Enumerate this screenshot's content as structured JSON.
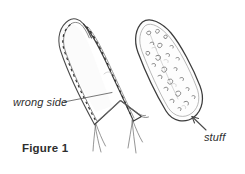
{
  "figure": {
    "caption": "Figure 1",
    "background_color": "#ffffff",
    "ink_color": "#3a3a3a",
    "light_ink_color": "#9a9a9a",
    "annotations": {
      "wrong_side_label": "wrong side",
      "stuff_label": "stuff"
    },
    "parts": [
      {
        "name": "sewn-cone-wrong-side-out",
        "description": "elongated cone of fabric, wrong side out, stitched along both long edges with dashed seam lines, open hem folded back at the bottom with loose threads"
      },
      {
        "name": "stuffed-cone",
        "description": "same cone turned right side out and filled with stuffing shown as small squiggle marks, rounded closed bottom"
      }
    ],
    "leaders": [
      {
        "name": "wrong-side-leader",
        "from_label": "wrong side",
        "points_to": "sewn-cone-wrong-side-out"
      },
      {
        "name": "stuff-arrow",
        "from_label": "stuff",
        "points_to": "stuffed-cone-bottom"
      }
    ]
  }
}
